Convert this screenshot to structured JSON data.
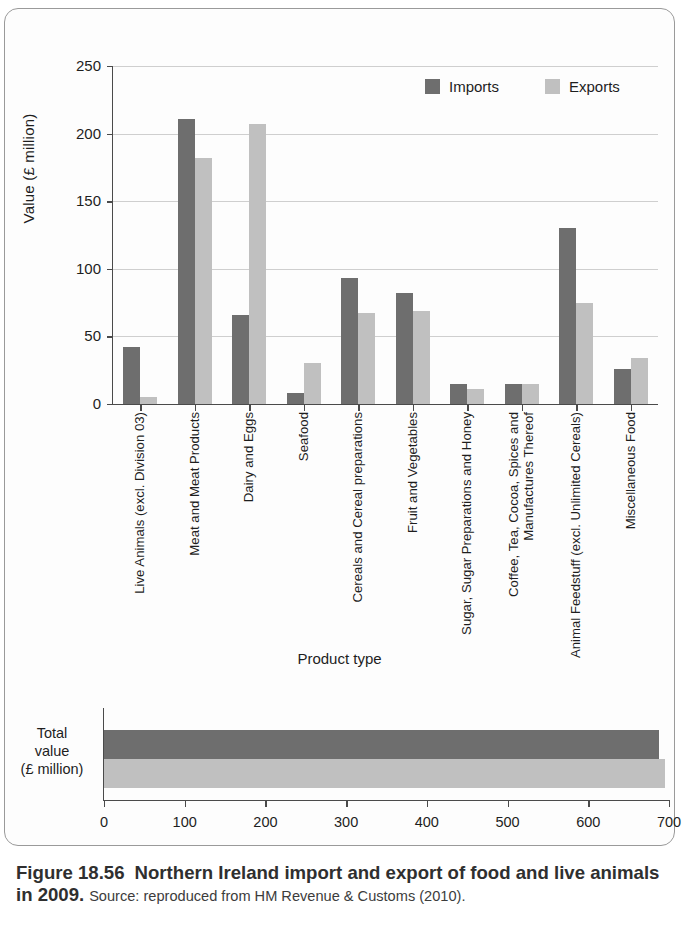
{
  "chart_data": [
    {
      "type": "bar",
      "title": "",
      "xlabel": "Product type",
      "ylabel": "Value (£ million)",
      "ylim": [
        0,
        250
      ],
      "yticks": [
        0,
        50,
        100,
        150,
        200,
        250
      ],
      "grid": true,
      "legend_position": "top-right",
      "categories": [
        "Live Animals (excl. Division 03)",
        "Meat and Meat Products",
        "Dairy and Eggs",
        "Seafood",
        "Cereals and Cereal preparations",
        "Fruit and Vegetables",
        "Sugar, Sugar Preparations and Honey",
        "Coffee, Tea, Cocoa, Spices and Manufactures Thereof",
        "Animal Feedstuff (excl. Unlimited Cereals)",
        "Miscellaneous Food"
      ],
      "series": [
        {
          "name": "Imports",
          "color": "#6e6e6e",
          "values": [
            42,
            211,
            66,
            8,
            93,
            82,
            15,
            15,
            130,
            26
          ]
        },
        {
          "name": "Exports",
          "color": "#c0c0c0",
          "values": [
            5,
            182,
            207,
            30,
            67,
            69,
            11,
            15,
            75,
            34
          ]
        }
      ]
    },
    {
      "type": "bar",
      "orientation": "horizontal",
      "title": "",
      "ylabel": "Total value (£ million)",
      "xlim": [
        0,
        700
      ],
      "xticks": [
        0,
        100,
        200,
        300,
        400,
        500,
        600,
        700
      ],
      "grid": false,
      "categories": [
        "Total value (£ million)"
      ],
      "series": [
        {
          "name": "Imports",
          "color": "#6e6e6e",
          "values": [
            688
          ]
        },
        {
          "name": "Exports",
          "color": "#c0c0c0",
          "values": [
            695
          ]
        }
      ]
    }
  ],
  "main": {
    "y_axis_title": "Value (£ million)",
    "x_axis_title": "Product type",
    "y_ticks": [
      "250",
      "200",
      "150",
      "100",
      "50",
      "0"
    ],
    "legend": [
      {
        "label": "Imports",
        "color": "#6e6e6e"
      },
      {
        "label": "Exports",
        "color": "#c0c0c0"
      }
    ],
    "categories": [
      {
        "label": "Live Animals (excl. Division 03)",
        "imports": 42,
        "exports": 5
      },
      {
        "label": "Meat and Meat Products",
        "imports": 211,
        "exports": 182
      },
      {
        "label": "Dairy and Eggs",
        "imports": 66,
        "exports": 207
      },
      {
        "label": "Seafood",
        "imports": 8,
        "exports": 30
      },
      {
        "label": "Cereals and Cereal preparations",
        "imports": 93,
        "exports": 67
      },
      {
        "label": "Fruit and Vegetables",
        "imports": 82,
        "exports": 69
      },
      {
        "label": "Sugar, Sugar Preparations and Honey",
        "imports": 15,
        "exports": 11
      },
      {
        "label": "Coffee, Tea, Cocoa, Spices and Manufactures Thereof",
        "imports": 15,
        "exports": 15
      },
      {
        "label": "Animal Feedstuff (excl. Unlimited Cereals)",
        "imports": 130,
        "exports": 75
      },
      {
        "label": "Miscellaneous Food",
        "imports": 26,
        "exports": 34
      }
    ]
  },
  "total": {
    "axis_label_line1": "Total",
    "axis_label_line2": "value",
    "axis_label_line3": "(£ million)",
    "x_ticks": [
      "0",
      "100",
      "200",
      "300",
      "400",
      "500",
      "600",
      "700"
    ],
    "imports": 688,
    "exports": 695
  },
  "caption": {
    "figure_number": "Figure 18.56",
    "title": "Northern Ireland import and export of food and live animals in 2009.",
    "source": "Source: reproduced from HM Revenue & Customs (2010)."
  }
}
